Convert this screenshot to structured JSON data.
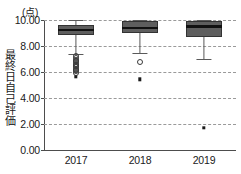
{
  "chart_data": {
    "type": "box",
    "title": "",
    "xlabel": "",
    "ylabel": "最終日自己評価",
    "yunit": "(点)",
    "ylim": [
      0.0,
      10.0
    ],
    "yticks": [
      0.0,
      2.0,
      4.0,
      6.0,
      8.0,
      10.0
    ],
    "ytick_labels": [
      "0.00",
      "2.00",
      "4.00",
      "6.00",
      "8.00",
      "10.00"
    ],
    "grid": true,
    "grid_style": "dashed-horizontal",
    "legend": "none",
    "categories": [
      "2017",
      "2018",
      "2019"
    ],
    "boxes": [
      {
        "category": "2017",
        "whisker_low": 7.4,
        "q1": 8.85,
        "median": 9.2,
        "q3": 9.6,
        "whisker_high": 10.0,
        "outliers_open": [
          7.2,
          7.05,
          6.95,
          6.85,
          6.75,
          6.65,
          6.55,
          6.45,
          6.35,
          6.25,
          6.15,
          6.05,
          5.95
        ],
        "outliers_extreme": [
          5.65
        ]
      },
      {
        "category": "2018",
        "whisker_low": 7.5,
        "q1": 9.0,
        "median": 9.4,
        "q3": 9.9,
        "whisker_high": 10.0,
        "outliers_open": [
          6.8
        ],
        "outliers_extreme": [
          5.45
        ]
      },
      {
        "category": "2019",
        "whisker_low": 7.0,
        "q1": 8.7,
        "median": 9.5,
        "q3": 9.9,
        "whisker_high": 10.0,
        "outliers_open": [],
        "outliers_extreme": [
          1.7
        ]
      }
    ],
    "colors": {
      "box_fill": "#5e5e5e",
      "box_edge": "#333333",
      "median": "#111111",
      "whisker": "#5a5a5a",
      "grid": "#9a9a9a",
      "axis": "#4d4d4d",
      "text": "#1a1a1a"
    }
  }
}
